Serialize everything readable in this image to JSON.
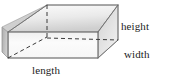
{
  "figure": {
    "name": "rectangular-prism-dimensions",
    "shape_label": "rectangular prism",
    "background_color": "#ffffff",
    "outline_color": "#6e6e6e",
    "hidden_edge_color": "#3a3a3a",
    "labels": {
      "height": "height",
      "width": "width",
      "length": "length"
    },
    "label_color": "#1c1c1c",
    "faces": {
      "top": {
        "name": "top-face",
        "fill_from": "#fbfbfb",
        "fill_to": "#d4d4d4"
      },
      "front": {
        "name": "front-face",
        "fill_from": "#f2f2f2",
        "fill_to": "#fdfdfd"
      },
      "left": {
        "name": "left-face",
        "fill_from": "#b4b4b4",
        "fill_to": "#cfcfcf"
      },
      "right": {
        "name": "right-face",
        "fill_from": "#d8d8d8",
        "fill_to": "#ededed"
      }
    },
    "vertices": {
      "front_bottom_left": [
        8,
        58
      ],
      "front_bottom_right": [
        98,
        58
      ],
      "front_top_left": [
        8,
        32
      ],
      "front_top_right": [
        98,
        32
      ],
      "back_top_left": [
        47,
        5
      ],
      "back_top_right": [
        118,
        5
      ],
      "back_bottom_right": [
        118,
        40
      ],
      "back_bottom_left_hidden": [
        47,
        37
      ]
    },
    "hidden_edges": [
      {
        "name": "hidden-vertical-edge",
        "from": [
          47,
          5
        ],
        "to": [
          47,
          37
        ]
      },
      {
        "name": "hidden-horizontal-edge",
        "from": [
          47,
          37
        ],
        "to": [
          118,
          40
        ]
      },
      {
        "name": "hidden-diagonal-edge",
        "from": [
          8,
          58
        ],
        "to": [
          47,
          37
        ]
      }
    ]
  }
}
